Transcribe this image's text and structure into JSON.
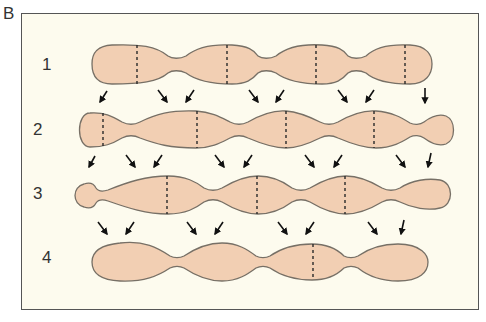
{
  "panel": {
    "label": "B"
  },
  "colors": {
    "background": "#fdfbee",
    "segment_fill": "#f2cfb3",
    "segment_stroke": "#777066",
    "divider": "#2a2a2a",
    "arrow": "#111111",
    "frame": "#555555"
  },
  "rows": [
    {
      "label": "1",
      "label_pos": [
        42,
        56
      ]
    },
    {
      "label": "2",
      "label_pos": [
        33,
        121
      ]
    },
    {
      "label": "3",
      "label_pos": [
        33,
        185
      ]
    },
    {
      "label": "4",
      "label_pos": [
        42,
        249
      ]
    }
  ]
}
